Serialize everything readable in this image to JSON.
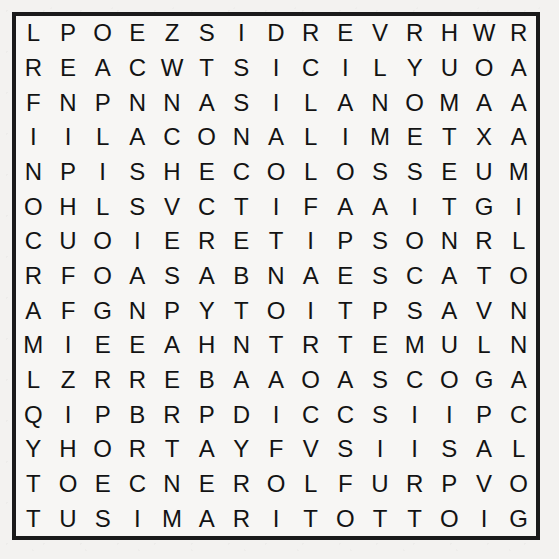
{
  "puzzle": {
    "type": "word-search",
    "rows": 15,
    "columns": 15,
    "letter_color": "#131313",
    "border_color": "#1a1a1a",
    "paper_color": "#f3f2f0",
    "grid_background": "#f7f6f4",
    "grid": [
      [
        "L",
        "P",
        "O",
        "E",
        "Z",
        "S",
        "I",
        "D",
        "R",
        "E",
        "V",
        "R",
        "H",
        "W",
        "R"
      ],
      [
        "R",
        "E",
        "A",
        "C",
        "W",
        "T",
        "S",
        "I",
        "C",
        "I",
        "L",
        "Y",
        "U",
        "O",
        "A"
      ],
      [
        "F",
        "N",
        "P",
        "N",
        "N",
        "A",
        "S",
        "I",
        "L",
        "A",
        "N",
        "O",
        "M",
        "A",
        "A"
      ],
      [
        "I",
        "I",
        "L",
        "A",
        "C",
        "O",
        "N",
        "A",
        "L",
        "I",
        "M",
        "E",
        "T",
        "X",
        "A"
      ],
      [
        "N",
        "P",
        "I",
        "S",
        "H",
        "E",
        "C",
        "O",
        "L",
        "O",
        "S",
        "S",
        "E",
        "U",
        "M"
      ],
      [
        "O",
        "H",
        "L",
        "S",
        "V",
        "C",
        "T",
        "I",
        "F",
        "A",
        "A",
        "I",
        "T",
        "G",
        "I"
      ],
      [
        "C",
        "U",
        "O",
        "I",
        "E",
        "R",
        "E",
        "T",
        "I",
        "P",
        "S",
        "O",
        "N",
        "R",
        "L"
      ],
      [
        "R",
        "F",
        "O",
        "A",
        "S",
        "A",
        "B",
        "N",
        "A",
        "E",
        "S",
        "C",
        "A",
        "T",
        "O"
      ],
      [
        "A",
        "F",
        "G",
        "N",
        "P",
        "Y",
        "T",
        "O",
        "I",
        "T",
        "P",
        "S",
        "A",
        "V",
        "N"
      ],
      [
        "M",
        "I",
        "E",
        "E",
        "A",
        "H",
        "N",
        "T",
        "R",
        "T",
        "E",
        "M",
        "U",
        "L",
        "N"
      ],
      [
        "L",
        "Z",
        "R",
        "R",
        "E",
        "B",
        "A",
        "A",
        "O",
        "A",
        "S",
        "C",
        "O",
        "G",
        "A"
      ],
      [
        "Q",
        "I",
        "P",
        "B",
        "R",
        "P",
        "D",
        "I",
        "C",
        "C",
        "S",
        "I",
        "I",
        "P",
        "C"
      ],
      [
        "Y",
        "H",
        "O",
        "R",
        "T",
        "A",
        "Y",
        "F",
        "V",
        "S",
        "I",
        "I",
        "S",
        "A",
        "L"
      ],
      [
        "T",
        "O",
        "E",
        "C",
        "N",
        "E",
        "R",
        "O",
        "L",
        "F",
        "U",
        "R",
        "P",
        "V",
        "O"
      ],
      [
        "T",
        "U",
        "S",
        "I",
        "M",
        "A",
        "R",
        "I",
        "T",
        "O",
        "T",
        "T",
        "O",
        "I",
        "G"
      ]
    ]
  }
}
